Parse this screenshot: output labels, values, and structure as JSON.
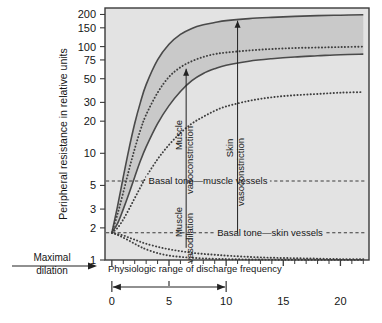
{
  "chart_data": {
    "type": "line",
    "title": "",
    "ylabel": "Peripheral resistance in relative units",
    "xlabel": "Physiologic range of discharge frequency",
    "yscale": "log",
    "ylim": [
      1,
      230
    ],
    "xlim": [
      -0.6,
      22.5
    ],
    "yticks": [
      1,
      2,
      3,
      5,
      10,
      20,
      30,
      50,
      75,
      100,
      150,
      200
    ],
    "ytick_labels": [
      "1",
      "2",
      "3",
      "5",
      "10",
      "20",
      "30",
      "50",
      "75",
      "100",
      "150",
      "200"
    ],
    "xticks": [
      0,
      5,
      10,
      15,
      20
    ],
    "xtick_labels": [
      "0",
      "5",
      "10",
      "15",
      "20"
    ],
    "xminor_step": 1,
    "grid": false,
    "legend": "none",
    "plot_bgcolor": "#e3e3e3",
    "band_color": "#c9c9c9",
    "curve_color": "#4a4a4a",
    "series": [
      {
        "name": "Muscle vasoconstriction upper bound",
        "style": "solid",
        "x": [
          0,
          0.5,
          1,
          1.5,
          2,
          2.5,
          3,
          4,
          5,
          6,
          7,
          8,
          9,
          10,
          12,
          14,
          16,
          18,
          20,
          22
        ],
        "y": [
          1.8,
          3.2,
          6.0,
          11.0,
          19.0,
          30.0,
          44.0,
          75.0,
          105.0,
          130.0,
          148.0,
          160.0,
          168.0,
          175.0,
          183.0,
          188.0,
          192.0,
          195.0,
          197.0,
          199.0
        ]
      },
      {
        "name": "Muscle vasoconstriction lower bound",
        "style": "solid",
        "x": [
          0,
          0.5,
          1,
          1.5,
          2,
          2.5,
          3,
          4,
          5,
          6,
          7,
          8,
          9,
          10,
          12,
          14,
          16,
          18,
          20,
          22
        ],
        "y": [
          1.8,
          2.2,
          3.0,
          4.2,
          6.0,
          8.5,
          11.5,
          19.0,
          28.0,
          38.0,
          48.0,
          56.0,
          62.0,
          67.0,
          73.0,
          77.0,
          80.0,
          82.0,
          84.0,
          85.0
        ]
      },
      {
        "name": "Muscle vasoconstriction mean",
        "style": "dotted",
        "x": [
          0,
          0.5,
          1,
          1.5,
          2,
          2.5,
          3,
          4,
          5,
          6,
          7,
          8,
          9,
          10,
          12,
          14,
          16,
          18,
          20,
          22
        ],
        "y": [
          1.8,
          2.7,
          4.3,
          7.0,
          11.0,
          16.5,
          23.0,
          37.0,
          52.0,
          64.0,
          73.0,
          80.0,
          85.0,
          88.0,
          92.0,
          95.0,
          97.0,
          98.0,
          99.0,
          100.0
        ]
      },
      {
        "name": "Skin vasoconstriction",
        "style": "dotted",
        "x": [
          0,
          0.5,
          1,
          1.5,
          2,
          2.5,
          3,
          4,
          5,
          6,
          7,
          8,
          9,
          10,
          12,
          14,
          16,
          18,
          20,
          22
        ],
        "y": [
          1.8,
          2.0,
          2.4,
          3.0,
          3.8,
          4.8,
          6.0,
          8.8,
          12.0,
          15.5,
          19.0,
          22.0,
          25.0,
          27.5,
          31.0,
          33.5,
          35.0,
          36.0,
          37.0,
          37.5
        ]
      },
      {
        "name": "Muscle vasodilation",
        "style": "dotted",
        "x": [
          0,
          0.5,
          1,
          1.5,
          2,
          2.5,
          3,
          4,
          5,
          6,
          7,
          8,
          9,
          10,
          12,
          14,
          16,
          18,
          20,
          22
        ],
        "y": [
          1.8,
          1.75,
          1.7,
          1.62,
          1.55,
          1.48,
          1.42,
          1.33,
          1.26,
          1.21,
          1.17,
          1.14,
          1.12,
          1.1,
          1.07,
          1.05,
          1.04,
          1.03,
          1.02,
          1.02
        ]
      },
      {
        "name": "Skin vasodilation",
        "style": "dotted",
        "x": [
          0,
          0.5,
          1,
          1.5,
          2,
          2.5,
          3,
          4,
          5,
          6,
          7,
          8,
          9,
          10,
          12,
          14,
          16,
          18,
          20,
          22
        ],
        "y": [
          1.8,
          1.72,
          1.62,
          1.52,
          1.42,
          1.33,
          1.26,
          1.16,
          1.1,
          1.07,
          1.05,
          1.035,
          1.025,
          1.02,
          1.012,
          1.008,
          1.005,
          1.004,
          1.003,
          1.002
        ]
      }
    ],
    "reference_lines": [
      {
        "name": "Basal tone - muscle vessels",
        "label": "Basal tone—muscle vessels",
        "y": 5.5,
        "style": "dashed"
      },
      {
        "name": "Basal tone - skin vessels",
        "label": "Basal tone—skin vessels",
        "y": 1.8,
        "style": "dashed"
      }
    ],
    "annotations": [
      {
        "name": "muscle-vasoconstriction",
        "label": "Muscle\nvasoconstriction",
        "line1": "Muscle",
        "line2": "vasoconstriction",
        "x": 6.5,
        "y_from": 5.5,
        "y_to": 62,
        "orientation": "vertical",
        "arrow": "up"
      },
      {
        "name": "skin-vasoconstriction",
        "label": "Skin\nvasoconstriction",
        "line1": "Skin",
        "line2": "vasoconstriction",
        "x": 11.0,
        "y_from": 1.8,
        "y_to": 175,
        "orientation": "vertical",
        "arrow": "up"
      },
      {
        "name": "muscle-vasodilation",
        "label": "Muscle\nvasodilation",
        "line1": "Muscle",
        "line2": "vasodilation",
        "x": 6.5,
        "y_from": 5.5,
        "y_to": 1.3,
        "orientation": "vertical",
        "arrow": "none"
      },
      {
        "name": "maximal-dilation",
        "label": "Maximal\ndilation",
        "line1": "Maximal",
        "line2": "dilation",
        "orientation": "horizontal",
        "arrow": "right"
      }
    ],
    "range_bar": {
      "name": "physiologic-range",
      "from": 0,
      "to": 10,
      "arrow": "both"
    }
  },
  "axes": {
    "y_title": "Peripheral resistance in relative units",
    "x_title": "Physiologic range of discharge frequency"
  },
  "labels": {
    "basal_muscle": "Basal tone—muscle vessels",
    "basal_skin": "Basal tone—skin vessels",
    "muscle_vc_1": "Muscle",
    "muscle_vc_2": "vasoconstriction",
    "skin_vc_1": "Skin",
    "skin_vc_2": "vasoconstriction",
    "muscle_vd_1": "Muscle",
    "muscle_vd_2": "vasodilation",
    "maximal_1": "Maximal",
    "maximal_2": "dilation"
  },
  "ytick": {
    "t200": "200",
    "t150": "150",
    "t100": "100",
    "t75": "75",
    "t50": "50",
    "t30": "30",
    "t20": "20",
    "t10": "10",
    "t5": "5",
    "t3": "3",
    "t2": "2",
    "t1": "1"
  },
  "xtick": {
    "t0": "0",
    "t5": "5",
    "t10": "10",
    "t15": "15",
    "t20": "20"
  },
  "colors": {
    "plot_bg": "#e3e3e3",
    "band": "#c9c9c9",
    "curve": "#4a4a4a",
    "text": "#161616",
    "frame": "#3a3a3a"
  }
}
